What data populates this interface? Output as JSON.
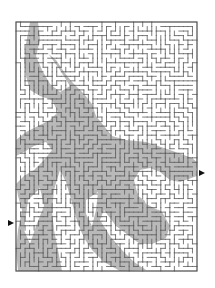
{
  "puzzle": {
    "type": "maze",
    "frame": {
      "left": 16,
      "top": 22,
      "right": 197,
      "bottom": 271
    },
    "grid": {
      "cols": 40,
      "rows": 55
    },
    "colors": {
      "background": "#ffffff",
      "wall": "#5a5a5a",
      "border": "#4a4a4a",
      "shade": "#b9b9b9",
      "arrow": "#111111"
    },
    "entrance": {
      "side": "left",
      "x": 8,
      "y": 220,
      "direction": "right",
      "row": 43
    },
    "exit": {
      "side": "right",
      "x": 199,
      "y": 170,
      "direction": "right",
      "row": 32
    },
    "shaded_regions": [
      [
        [
          30,
          22
        ],
        [
          38,
          22
        ],
        [
          40,
          40
        ],
        [
          46,
          52
        ],
        [
          56,
          60
        ],
        [
          64,
          72
        ],
        [
          72,
          82
        ],
        [
          84,
          94
        ],
        [
          92,
          104
        ],
        [
          96,
          116
        ],
        [
          104,
          126
        ],
        [
          112,
          136
        ],
        [
          126,
          140
        ],
        [
          146,
          142
        ],
        [
          170,
          150
        ],
        [
          192,
          158
        ],
        [
          197,
          162
        ],
        [
          197,
          176
        ],
        [
          180,
          182
        ],
        [
          170,
          180
        ],
        [
          160,
          172
        ],
        [
          150,
          168
        ],
        [
          140,
          170
        ],
        [
          134,
          180
        ],
        [
          138,
          196
        ],
        [
          150,
          204
        ],
        [
          162,
          212
        ],
        [
          170,
          226
        ],
        [
          166,
          238
        ],
        [
          152,
          244
        ],
        [
          140,
          244
        ],
        [
          132,
          238
        ],
        [
          124,
          232
        ],
        [
          116,
          226
        ],
        [
          110,
          218
        ],
        [
          104,
          210
        ],
        [
          100,
          220
        ],
        [
          110,
          236
        ],
        [
          122,
          250
        ],
        [
          134,
          262
        ],
        [
          146,
          270
        ],
        [
          120,
          271
        ],
        [
          104,
          262
        ],
        [
          92,
          250
        ],
        [
          84,
          238
        ],
        [
          78,
          224
        ],
        [
          74,
          210
        ],
        [
          70,
          196
        ],
        [
          66,
          182
        ],
        [
          60,
          170
        ],
        [
          54,
          190
        ],
        [
          52,
          210
        ],
        [
          54,
          230
        ],
        [
          58,
          250
        ],
        [
          62,
          271
        ],
        [
          18,
          271
        ],
        [
          16,
          250
        ],
        [
          18,
          230
        ],
        [
          22,
          210
        ],
        [
          18,
          196
        ],
        [
          16,
          184
        ],
        [
          24,
          176
        ],
        [
          34,
          170
        ],
        [
          44,
          160
        ],
        [
          52,
          150
        ],
        [
          46,
          142
        ],
        [
          34,
          146
        ],
        [
          24,
          152
        ],
        [
          16,
          156
        ],
        [
          16,
          140
        ],
        [
          26,
          132
        ],
        [
          38,
          126
        ],
        [
          50,
          120
        ],
        [
          58,
          112
        ],
        [
          52,
          100
        ],
        [
          40,
          96
        ],
        [
          30,
          90
        ],
        [
          26,
          76
        ],
        [
          24,
          60
        ],
        [
          26,
          44
        ]
      ],
      [
        [
          70,
          196
        ],
        [
          80,
          188
        ],
        [
          92,
          180
        ],
        [
          104,
          174
        ],
        [
          118,
          166
        ],
        [
          128,
          160
        ],
        [
          120,
          150
        ],
        [
          108,
          148
        ],
        [
          96,
          150
        ],
        [
          86,
          158
        ],
        [
          80,
          168
        ],
        [
          74,
          180
        ]
      ]
    ],
    "unshaded_holes": [
      [
        [
          40,
          40
        ],
        [
          50,
          56
        ],
        [
          60,
          70
        ],
        [
          70,
          86
        ],
        [
          60,
          92
        ],
        [
          50,
          84
        ],
        [
          42,
          70
        ],
        [
          36,
          56
        ]
      ],
      [
        [
          28,
          200
        ],
        [
          40,
          188
        ],
        [
          44,
          206
        ],
        [
          36,
          226
        ],
        [
          30,
          244
        ],
        [
          24,
          230
        ]
      ],
      [
        [
          86,
          200
        ],
        [
          98,
          192
        ],
        [
          96,
          210
        ],
        [
          92,
          226
        ],
        [
          86,
          214
        ]
      ],
      [
        [
          140,
          190
        ],
        [
          154,
          184
        ],
        [
          164,
          196
        ],
        [
          158,
          210
        ],
        [
          146,
          204
        ]
      ]
    ]
  },
  "watermark": {
    "top_text": "",
    "bottom_text": ""
  }
}
